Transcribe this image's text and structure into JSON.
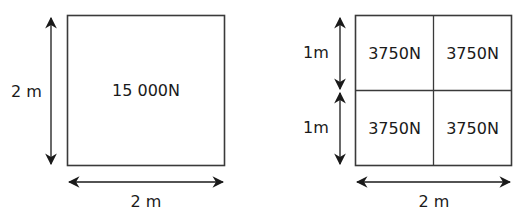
{
  "left_diagram": {
    "title": "single square area",
    "height_label": "2 m",
    "width_label": "2 m",
    "force_label": "15 000N"
  },
  "right_diagram": {
    "title": "square divided into four 1 m squares",
    "height_labels": [
      "1m",
      "1m"
    ],
    "width_label": "2 m",
    "cells": [
      "3750N",
      "3750N",
      "3750N",
      "3750N"
    ]
  },
  "colors": {
    "line": "#3a3a3a",
    "text": "#1a1a1a",
    "background": "#ffffff"
  }
}
